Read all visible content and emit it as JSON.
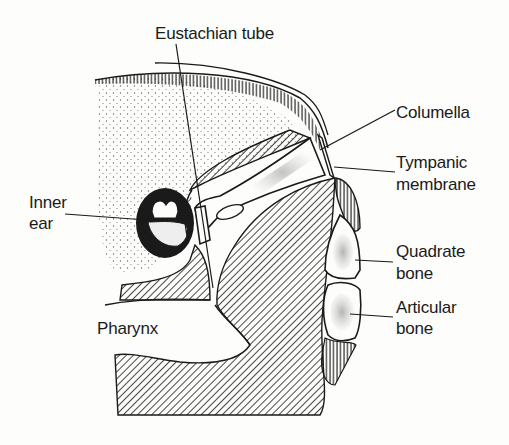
{
  "figure": {
    "type": "anatomical-diagram"
  },
  "labels": {
    "eustachian_tube": "Eustachian tube",
    "columella": "Columella",
    "tympanic_line1": "Tympanic",
    "tympanic_line2": "membrane",
    "inner_ear_line1": "Inner",
    "inner_ear_line2": "ear",
    "quadrate_line1": "Quadrate",
    "quadrate_line2": "bone",
    "articular_line1": "Articular",
    "articular_line2": "bone",
    "pharynx": "Pharynx"
  },
  "colors": {
    "ink": "#1a1a1a",
    "paper": "#fdfdfb"
  }
}
